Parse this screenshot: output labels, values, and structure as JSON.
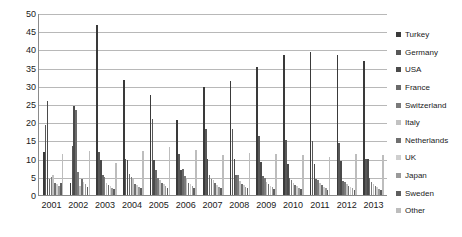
{
  "chart_data": {
    "type": "bar",
    "title": "",
    "subtitle": "",
    "xlabel": "",
    "ylabel": "",
    "ylim": [
      0,
      50
    ],
    "ytick_step": 5,
    "yticks": [
      50,
      45,
      40,
      35,
      30,
      25,
      20,
      15,
      10,
      5,
      0
    ],
    "grid": true,
    "legend_position": "right",
    "categories": [
      "2001",
      "2002",
      "2003",
      "2004",
      "2005",
      "2006",
      "2007",
      "2008",
      "2009",
      "2010",
      "2011",
      "2012",
      "2013"
    ],
    "series": [
      {
        "name": "Turkey",
        "color": "#3a3a3a",
        "values": [
          11.8,
          3.2,
          46.8,
          31.5,
          27.5,
          20.7,
          29.6,
          31.2,
          35.1,
          38.4,
          39.3,
          38.5,
          36.9
        ]
      },
      {
        "name": "Germany",
        "color": "#585858",
        "values": [
          19.3,
          13.5,
          11.8,
          10.0,
          21.0,
          11.3,
          18.1,
          18.0,
          16.2,
          15.1,
          14.8,
          14.4,
          10.0
        ]
      },
      {
        "name": "USA",
        "color": "#4a4a4a",
        "values": [
          25.7,
          24.4,
          9.5,
          9.6,
          9.5,
          6.9,
          9.9,
          9.8,
          9.2,
          8.5,
          8.6,
          9.4,
          9.9
        ]
      },
      {
        "name": "France",
        "color": "#6a6a6a",
        "values": [
          4.4,
          23.4,
          5.6,
          5.9,
          7.0,
          7.2,
          5.5,
          5.5,
          5.1,
          4.7,
          4.3,
          3.9,
          4.6
        ]
      },
      {
        "name": "Switzerland",
        "color": "#7a7a7a",
        "values": [
          4.9,
          6.2,
          5.0,
          4.9,
          4.7,
          5.1,
          4.3,
          5.4,
          4.6,
          4.2,
          4.1,
          3.6,
          3.5
        ]
      },
      {
        "name": "Italy",
        "color": "#c2c2c2",
        "values": [
          5.6,
          2.6,
          3.2,
          4.4,
          4.2,
          4.3,
          4.0,
          3.8,
          3.7,
          3.4,
          3.2,
          2.9,
          3.0
        ]
      },
      {
        "name": "Netherlands",
        "color": "#6f6f6f",
        "values": [
          3.3,
          4.5,
          2.8,
          3.1,
          3.3,
          3.4,
          3.2,
          3.1,
          3.0,
          2.8,
          2.7,
          2.5,
          2.4
        ]
      },
      {
        "name": "UK",
        "color": "#cfcfcf",
        "values": [
          3.0,
          3.7,
          2.4,
          2.7,
          2.9,
          2.9,
          2.8,
          2.7,
          2.6,
          2.4,
          2.3,
          2.2,
          2.1
        ]
      },
      {
        "name": "Japan",
        "color": "#9a9a9a",
        "values": [
          2.6,
          3.1,
          2.0,
          2.3,
          2.5,
          2.4,
          2.3,
          2.2,
          2.1,
          2.0,
          1.9,
          1.8,
          1.7
        ]
      },
      {
        "name": "Sweden",
        "color": "#5e5e5e",
        "values": [
          3.4,
          2.2,
          1.6,
          1.9,
          2.0,
          2.0,
          1.9,
          1.8,
          1.7,
          1.6,
          1.5,
          1.4,
          1.3
        ]
      },
      {
        "name": "Other",
        "color": "#bdbdbd",
        "values": [
          11.4,
          12.1,
          8.8,
          12.1,
          13.1,
          12.5,
          11.1,
          11.6,
          11.2,
          11.1,
          10.5,
          11.2,
          11.0
        ]
      }
    ]
  },
  "legend": {
    "items": [
      {
        "label": "Turkey"
      },
      {
        "label": "Germany"
      },
      {
        "label": "USA"
      },
      {
        "label": "France"
      },
      {
        "label": "Switzerland"
      },
      {
        "label": "Italy"
      },
      {
        "label": "Netherlands"
      },
      {
        "label": "UK"
      },
      {
        "label": "Japan"
      },
      {
        "label": "Sweden"
      },
      {
        "label": "Other"
      }
    ]
  }
}
